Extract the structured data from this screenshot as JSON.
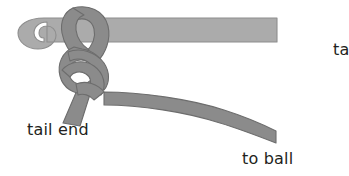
{
  "figure": {
    "background_color": "#ffffff",
    "width": 349,
    "height": 176,
    "labels": {
      "tail_end": "tail end",
      "to_ball": "to ball",
      "cropped_right": "ta"
    },
    "label_color": "#231f20",
    "parts": {
      "hook": {
        "name": "crochet-hook",
        "fill_color": "#ababab",
        "outline_color": "#8e8e8e"
      },
      "yarn": {
        "name": "yarn-strand",
        "fill_color": "#8b8b8b",
        "outline_color": "#6d6d6d"
      },
      "knot": {
        "name": "slip-knot",
        "fill_color": "#8b8b8b",
        "outline_color": "#6d6d6d"
      }
    }
  }
}
